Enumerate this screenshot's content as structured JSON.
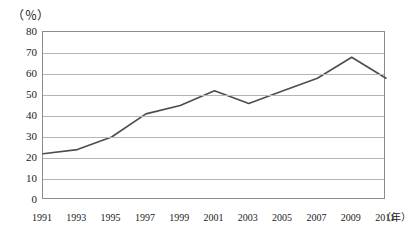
{
  "chart_data": {
    "type": "line",
    "title": "",
    "subtitle": "",
    "xlabel": "年",
    "ylabel": "（％）",
    "unit_label": "（％）",
    "x_axis_unit_suffix": "（年）",
    "categories": [
      "1991",
      "1993",
      "1995",
      "1997",
      "1999",
      "2001",
      "2003",
      "2005",
      "2007",
      "2009",
      "2011"
    ],
    "values": [
      22,
      24,
      30,
      41,
      45,
      52,
      46,
      52,
      58,
      68,
      58
    ],
    "series": [
      {
        "name": "",
        "values": [
          22,
          24,
          30,
          41,
          45,
          52,
          46,
          52,
          58,
          68,
          58
        ]
      }
    ],
    "ylim": [
      0,
      80
    ],
    "y_ticks": [
      "0",
      "10",
      "20",
      "30",
      "40",
      "50",
      "60",
      "70",
      "80"
    ],
    "y_tick_values": [
      0,
      10,
      20,
      30,
      40,
      50,
      60,
      70,
      80
    ],
    "xlim": [
      "1991",
      "2011"
    ],
    "grid": "horizontal",
    "legend": "none",
    "legend_position": "none",
    "line_color": "#4d4d4d",
    "grid_color": "#b5b5b5",
    "axis_color": "#8c8c8c",
    "background_color": "#ffffff",
    "markers": "none",
    "annotations": []
  }
}
